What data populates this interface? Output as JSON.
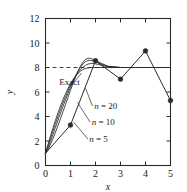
{
  "chart_data": {
    "type": "line",
    "title": "",
    "xlabel": "x",
    "ylabel": "y",
    "xlim": [
      0,
      5
    ],
    "ylim": [
      0,
      12
    ],
    "xticks": [
      0,
      1,
      2,
      3,
      4,
      5
    ],
    "yticks": [
      0,
      2,
      4,
      6,
      8,
      10,
      12
    ],
    "grid": false,
    "legend_position": "inline-annotations",
    "annotations": [
      {
        "name": "exact-label",
        "text": "Exact",
        "x": 0.55,
        "y": 6.6
      },
      {
        "name": "n20-label",
        "text": "n = 20",
        "x": 1.95,
        "y": 4.6
      },
      {
        "name": "n10-label",
        "text": "n = 10",
        "x": 1.85,
        "y": 3.3
      },
      {
        "name": "n5-label",
        "text": "n = 5",
        "x": 1.75,
        "y": 1.9
      }
    ],
    "reference_lines": [
      {
        "name": "dashed-asymptote",
        "orientation": "horizontal",
        "value": 8,
        "style": "dashed"
      }
    ],
    "series": [
      {
        "name": "Exact",
        "style": "solid",
        "markers": false,
        "x": [
          0,
          0.1,
          0.2,
          0.3,
          0.4,
          0.5,
          0.6,
          0.7,
          0.8,
          0.9,
          1.0,
          1.1,
          1.2,
          1.3,
          1.4,
          1.5,
          1.6,
          1.7,
          1.8,
          1.9,
          2.0,
          2.5,
          3.0,
          3.5,
          4.0,
          4.5,
          5.0
        ],
        "y": [
          1.0,
          1.72,
          2.42,
          3.08,
          3.7,
          4.3,
          4.86,
          5.38,
          5.86,
          6.3,
          6.7,
          7.02,
          7.3,
          7.52,
          7.7,
          7.84,
          7.92,
          7.96,
          7.99,
          8.0,
          8.0,
          8.0,
          8.0,
          8.0,
          8.0,
          8.0,
          8.0
        ]
      },
      {
        "name": "n = 20",
        "style": "solid",
        "markers": false,
        "x": [
          0,
          0.1,
          0.2,
          0.3,
          0.4,
          0.5,
          0.6,
          0.7,
          0.8,
          0.9,
          1.0,
          1.1,
          1.2,
          1.3,
          1.4,
          1.5,
          1.6,
          1.7,
          1.8,
          1.9,
          2.0,
          2.5,
          3.0,
          3.5,
          4.0,
          4.5,
          5.0
        ],
        "y": [
          1.0,
          1.6,
          2.22,
          2.84,
          3.44,
          4.02,
          4.58,
          5.12,
          5.62,
          6.1,
          6.54,
          6.94,
          7.28,
          7.58,
          7.84,
          8.04,
          8.18,
          8.28,
          8.32,
          8.34,
          8.3,
          8.05,
          8.0,
          8.0,
          8.0,
          8.0,
          8.0
        ]
      },
      {
        "name": "n = 10",
        "style": "solid",
        "markers": false,
        "x": [
          0,
          0.1,
          0.2,
          0.3,
          0.4,
          0.5,
          0.6,
          0.7,
          0.8,
          0.9,
          1.0,
          1.1,
          1.2,
          1.3,
          1.4,
          1.5,
          1.6,
          1.7,
          1.8,
          1.9,
          2.0,
          2.5,
          3.0,
          3.5,
          4.0,
          4.5,
          5.0
        ],
        "y": [
          1.0,
          1.45,
          1.98,
          2.54,
          3.12,
          3.7,
          4.26,
          4.82,
          5.36,
          5.88,
          6.38,
          6.86,
          7.3,
          7.7,
          8.04,
          8.3,
          8.48,
          8.58,
          8.58,
          8.54,
          8.45,
          8.08,
          8.0,
          8.0,
          8.0,
          8.0,
          8.0
        ]
      },
      {
        "name": "n = 5",
        "style": "solid",
        "markers": false,
        "x": [
          0,
          0.1,
          0.2,
          0.3,
          0.4,
          0.5,
          0.6,
          0.7,
          0.8,
          0.9,
          1.0,
          1.1,
          1.2,
          1.3,
          1.4,
          1.5,
          1.6,
          1.7,
          1.8,
          1.9,
          2.0,
          2.5,
          3.0,
          3.5,
          4.0,
          4.5,
          5.0
        ],
        "y": [
          1.0,
          1.3,
          1.72,
          2.2,
          2.72,
          3.26,
          3.82,
          4.4,
          4.98,
          5.56,
          6.14,
          6.7,
          7.22,
          7.7,
          8.12,
          8.44,
          8.66,
          8.76,
          8.74,
          8.66,
          8.55,
          8.1,
          8.0,
          8.0,
          8.0,
          8.0,
          8.0
        ]
      },
      {
        "name": "data-points",
        "style": "solid",
        "markers": true,
        "x": [
          0,
          1,
          2,
          3,
          4,
          5
        ],
        "y": [
          1.0,
          3.3,
          8.55,
          7.05,
          9.35,
          5.3
        ]
      }
    ]
  }
}
